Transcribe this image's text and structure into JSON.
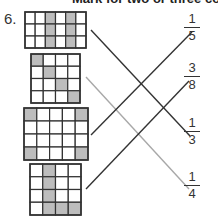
{
  "header": {
    "text": "Mark for two or three correct"
  },
  "question": {
    "number": "6."
  },
  "colors": {
    "shade": "#bdbdbd",
    "grid_line": "#333333",
    "line_dark": "#333333",
    "line_light": "#a8a8a8"
  },
  "grids": [
    {
      "cols": 6,
      "rows": 3,
      "shaded": [
        [
          0,
          2
        ],
        [
          0,
          4
        ],
        [
          1,
          2
        ],
        [
          1,
          4
        ],
        [
          2,
          2
        ],
        [
          2,
          4
        ]
      ]
    },
    {
      "cols": 4,
      "rows": 4,
      "shaded": [
        [
          0,
          0
        ],
        [
          1,
          1
        ],
        [
          2,
          2
        ],
        [
          3,
          3
        ]
      ]
    },
    {
      "cols": 5,
      "rows": 4,
      "shaded": [
        [
          0,
          0
        ],
        [
          0,
          4
        ],
        [
          3,
          0
        ],
        [
          3,
          4
        ]
      ]
    },
    {
      "cols": 4,
      "rows": 4,
      "shaded": [
        [
          0,
          1
        ],
        [
          1,
          1
        ],
        [
          2,
          1
        ],
        [
          3,
          1
        ],
        [
          3,
          2
        ],
        [
          3,
          3
        ]
      ]
    }
  ],
  "fractions": [
    {
      "numerator": "1",
      "denominator": "5"
    },
    {
      "numerator": "3",
      "denominator": "8"
    },
    {
      "numerator": "1",
      "denominator": "3"
    },
    {
      "numerator": "1",
      "denominator": "4"
    }
  ],
  "matches": [
    {
      "grid": 0,
      "fraction": 2,
      "style": "dark"
    },
    {
      "grid": 1,
      "fraction": 3,
      "style": "light"
    },
    {
      "grid": 2,
      "fraction": 0,
      "style": "dark"
    },
    {
      "grid": 3,
      "fraction": 1,
      "style": "dark"
    }
  ]
}
